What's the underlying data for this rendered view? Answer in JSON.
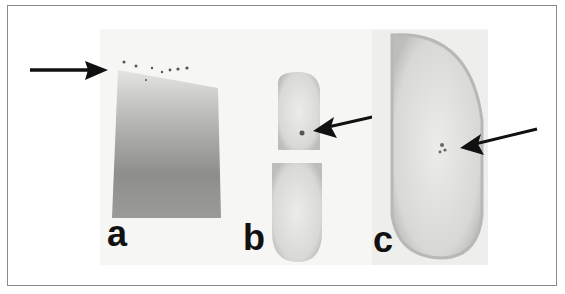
{
  "figure": {
    "panels": [
      {
        "id": "a",
        "label": "a",
        "content": "smear lane with bands marked by arrow"
      },
      {
        "id": "b",
        "label": "b",
        "content": "two halves of a seed section with stained spot marked by arrow"
      },
      {
        "id": "c",
        "label": "c",
        "content": "elongated embryo section with stained spot marked by arrow"
      }
    ],
    "colors": {
      "frame": "#8a8a8a",
      "arrow": "#111111",
      "smear_dark": "#8c8c8c",
      "tissue_light": "#d9d9d6"
    }
  }
}
